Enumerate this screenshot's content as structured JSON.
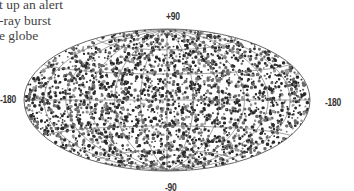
{
  "caption": {
    "lines": [
      "t up an alert",
      "-ray burst",
      "e globe"
    ]
  },
  "chart_data": {
    "type": "scatter",
    "projection": "aitoff-hammer (elliptical all-sky map)",
    "title": "",
    "axis_labels": {
      "top": "+90",
      "bottom": "-90",
      "left": "-180",
      "right": "-180"
    },
    "xlim": [
      -180,
      180
    ],
    "ylim": [
      -90,
      90
    ],
    "grid": true,
    "point_color": "#333333",
    "distribution": "isotropic",
    "approx_point_count": 2700
  },
  "colors": {
    "ellipse_stroke": "#666666",
    "grid": "#777777",
    "dots_dark": "#2a2a2a",
    "dots_mid": "#6a6a6a"
  }
}
